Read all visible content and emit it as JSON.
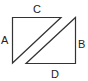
{
  "diagram": {
    "labels": {
      "a": "A",
      "b": "B",
      "c": "C",
      "d": "D"
    },
    "stroke_color": "#333333",
    "shapes": [
      {
        "name": "left-triangle",
        "points": "12.5,17.5 61,17.5 12.5,63"
      },
      {
        "name": "right-triangle",
        "points": "75.5,17.5 75.5,63.5 26,63.5"
      }
    ]
  }
}
